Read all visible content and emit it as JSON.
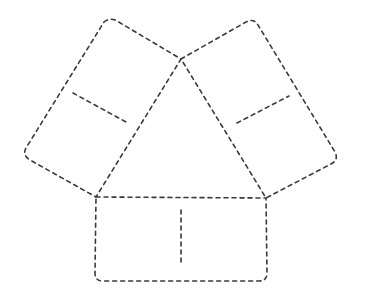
{
  "diagram": {
    "stroke_color": "#3a3a3a",
    "background": "#ffffff",
    "shapes": {
      "left_rect": {
        "corners": [
          [
            110,
            19
          ],
          [
            181,
            59
          ],
          [
            96,
            197
          ],
          [
            24,
            158
          ]
        ],
        "divider": [
          [
            73,
            93
          ],
          [
            126,
            122
          ]
        ]
      },
      "right_rect": {
        "corners": [
          [
            253,
            19
          ],
          [
            337,
            160
          ],
          [
            266,
            198
          ],
          [
            181,
            59
          ]
        ],
        "divider": [
          [
            237,
            123
          ],
          [
            289,
            96
          ]
        ]
      },
      "bottom_rect": {
        "corners": [
          [
            96,
            197
          ],
          [
            266,
            198
          ],
          [
            267,
            281
          ],
          [
            95,
            280
          ]
        ],
        "divider": [
          [
            181,
            210
          ],
          [
            181,
            265
          ]
        ]
      },
      "center_triangle": {
        "vertices": [
          [
            181,
            59
          ],
          [
            96,
            197
          ],
          [
            266,
            198
          ]
        ]
      }
    }
  }
}
